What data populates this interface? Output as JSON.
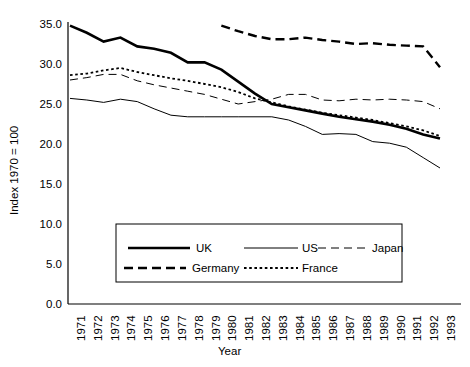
{
  "chart_data": {
    "type": "line",
    "title": "",
    "xlabel": "Year",
    "ylabel": "Index 1970 = 100",
    "xlim": [
      1971,
      1993
    ],
    "ylim": [
      0.0,
      35.0
    ],
    "grid": false,
    "legend_position": "lower-center-inside",
    "x": [
      1971,
      1972,
      1973,
      1974,
      1975,
      1976,
      1977,
      1978,
      1979,
      1980,
      1981,
      1982,
      1983,
      1984,
      1985,
      1986,
      1987,
      1988,
      1989,
      1990,
      1991,
      1992,
      1993
    ],
    "categories": [
      "1971",
      "1972",
      "1973",
      "1974",
      "1975",
      "1976",
      "1977",
      "1978",
      "1979",
      "1980",
      "1981",
      "1982",
      "1983",
      "1984",
      "1985",
      "1986",
      "1987",
      "1988",
      "1989",
      "1990",
      "1991",
      "1992",
      "1993"
    ],
    "ytick_labels": [
      "0.0",
      "5.0",
      "10.0",
      "15.0",
      "20.0",
      "25.0",
      "30.0",
      "35.0"
    ],
    "ytick_values": [
      0.0,
      5.0,
      10.0,
      15.0,
      20.0,
      25.0,
      30.0,
      35.0
    ],
    "series": [
      {
        "name": "UK",
        "style": "solid",
        "width": 2.6,
        "color": "#000000",
        "x": [
          1971,
          1972,
          1973,
          1974,
          1975,
          1976,
          1977,
          1978,
          1979,
          1980,
          1981,
          1982,
          1983,
          1984,
          1985,
          1986,
          1987,
          1988,
          1989,
          1990,
          1991,
          1992,
          1993
        ],
        "values": [
          34.8,
          33.9,
          32.8,
          33.3,
          32.2,
          31.9,
          31.4,
          30.2,
          30.2,
          29.3,
          27.8,
          26.3,
          25.0,
          24.6,
          24.2,
          23.8,
          23.4,
          23.1,
          22.8,
          22.4,
          21.9,
          21.2,
          20.7
        ]
      },
      {
        "name": "US",
        "style": "solid",
        "width": 1.0,
        "color": "#000000",
        "x": [
          1971,
          1972,
          1973,
          1974,
          1975,
          1976,
          1977,
          1978,
          1979,
          1980,
          1981,
          1982,
          1983,
          1984,
          1985,
          1986,
          1987,
          1988,
          1989,
          1990,
          1991,
          1992,
          1993
        ],
        "values": [
          25.7,
          25.5,
          25.2,
          25.6,
          25.3,
          24.4,
          23.6,
          23.4,
          23.4,
          23.4,
          23.4,
          23.4,
          23.4,
          23.0,
          22.2,
          21.2,
          21.3,
          21.2,
          20.3,
          20.1,
          19.6,
          18.3,
          17.0
        ]
      },
      {
        "name": "Japan",
        "style": "longdash",
        "width": 1.0,
        "color": "#000000",
        "x": [
          1971,
          1972,
          1973,
          1974,
          1975,
          1976,
          1977,
          1978,
          1979,
          1980,
          1981,
          1982,
          1983,
          1984,
          1985,
          1986,
          1987,
          1988,
          1989,
          1990,
          1991,
          1992,
          1993
        ],
        "values": [
          28.0,
          28.3,
          28.7,
          28.7,
          27.9,
          27.4,
          27.0,
          26.6,
          26.2,
          25.6,
          25.0,
          25.3,
          25.6,
          26.2,
          26.2,
          25.5,
          25.4,
          25.6,
          25.5,
          25.6,
          25.5,
          25.3,
          24.4
        ]
      },
      {
        "name": "Germany",
        "style": "dash",
        "width": 2.4,
        "color": "#000000",
        "x": [
          1980,
          1981,
          1982,
          1983,
          1984,
          1985,
          1986,
          1987,
          1988,
          1989,
          1990,
          1991,
          1992,
          1993
        ],
        "values": [
          34.8,
          34.1,
          33.5,
          33.1,
          33.1,
          33.3,
          33.0,
          32.8,
          32.5,
          32.6,
          32.4,
          32.3,
          32.2,
          29.6
        ]
      },
      {
        "name": "France",
        "style": "dot",
        "width": 1.8,
        "color": "#000000",
        "x": [
          1971,
          1972,
          1973,
          1974,
          1975,
          1976,
          1977,
          1978,
          1979,
          1980,
          1981,
          1982,
          1983,
          1984,
          1985,
          1986,
          1987,
          1988,
          1989,
          1990,
          1991,
          1992,
          1993
        ],
        "values": [
          28.6,
          28.8,
          29.2,
          29.5,
          29.0,
          28.6,
          28.2,
          27.9,
          27.5,
          27.1,
          26.5,
          25.7,
          25.2,
          24.7,
          24.3,
          23.9,
          23.6,
          23.3,
          23.0,
          22.6,
          22.2,
          21.7,
          21.0
        ]
      }
    ]
  },
  "legend": {
    "entries": [
      {
        "label": "UK",
        "style": "solid-thick"
      },
      {
        "label": "US",
        "style": "solid-thin"
      },
      {
        "label": "Japan",
        "style": "longdash-thin"
      },
      {
        "label": "Germany",
        "style": "dash-thick"
      },
      {
        "label": "France",
        "style": "dot"
      }
    ]
  }
}
